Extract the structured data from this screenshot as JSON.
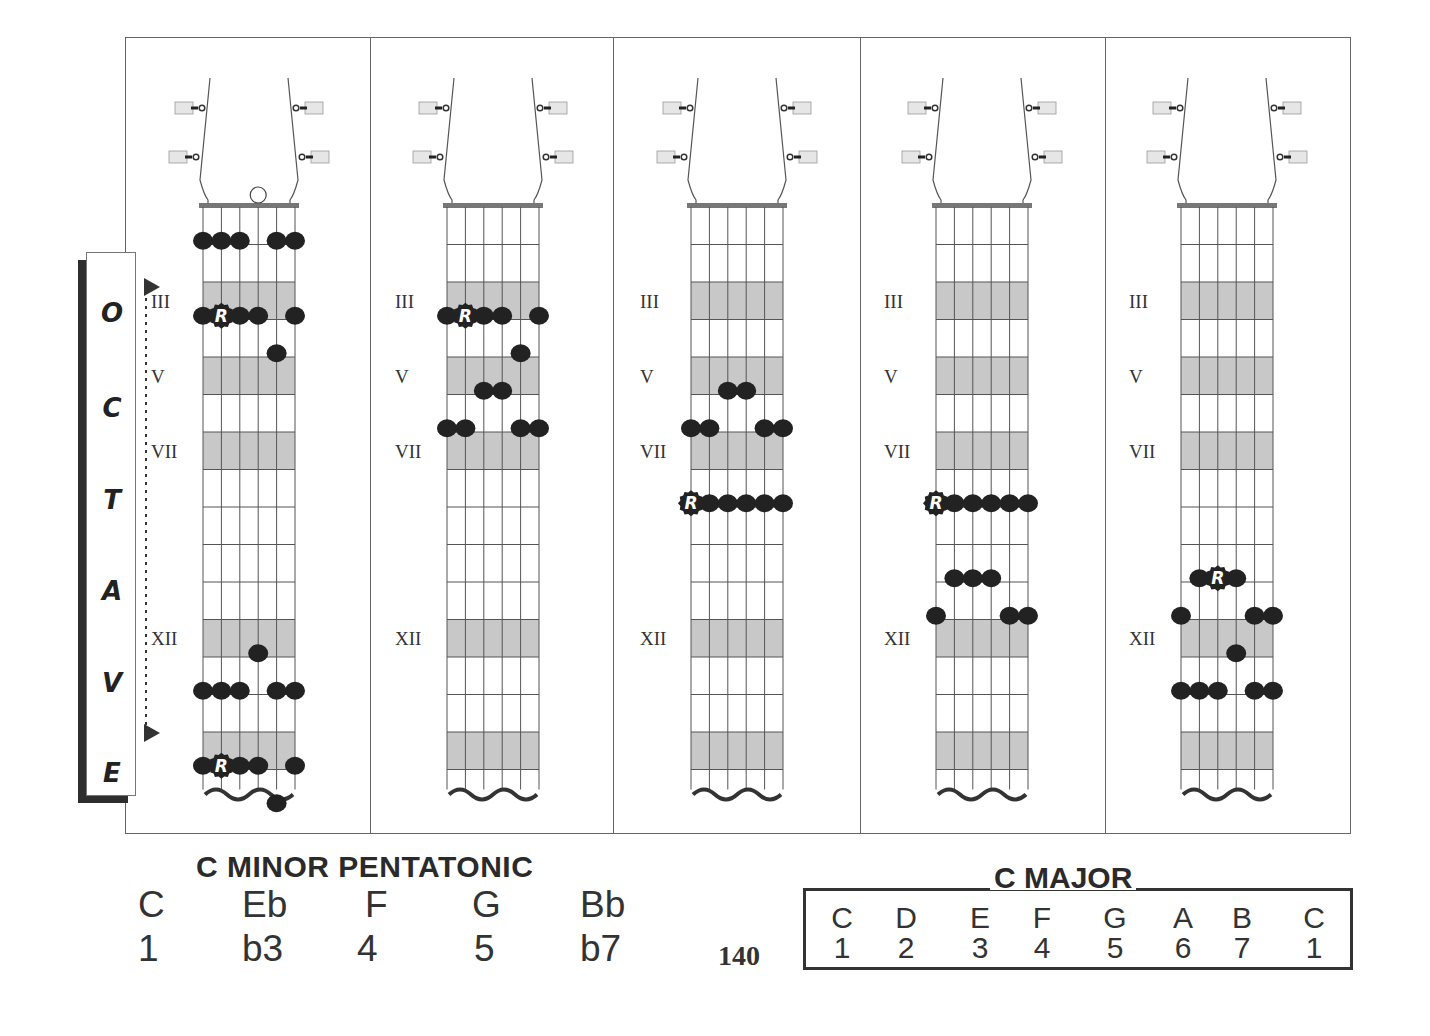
{
  "page": {
    "page_number": "140",
    "colors": {
      "fret_shading": "#c8c8c8",
      "dot": "#222222",
      "line": "#555555",
      "text": "#333333"
    }
  },
  "octave_label": {
    "letters": [
      "O",
      "C",
      "T",
      "A",
      "V",
      "E"
    ],
    "word": "OCTAVE"
  },
  "fretboard_config": {
    "strings": 6,
    "frets_shown": 15,
    "shaded_frets": [
      3,
      5,
      7,
      12,
      15
    ],
    "position_markers": [
      {
        "fret": 3,
        "label": "III"
      },
      {
        "fret": 5,
        "label": "V"
      },
      {
        "fret": 7,
        "label": "VII"
      },
      {
        "fret": 12,
        "label": "XII"
      }
    ],
    "root_symbol": "R",
    "string_order_note": "string 6 = low E (left) ... string 1 = high E (right)"
  },
  "diagrams": [
    {
      "id": "pattern-1",
      "open_string_marker": {
        "string": 3,
        "label": "open circle above nut"
      },
      "notes": [
        {
          "fret": 1,
          "strings": [
            6,
            5,
            4,
            2,
            1
          ]
        },
        {
          "fret": 3,
          "strings": [
            6,
            5,
            4,
            3,
            1
          ],
          "root_string": 5
        },
        {
          "fret": 4,
          "strings": [
            2
          ]
        },
        {
          "fret": 12,
          "strings": [
            3
          ]
        },
        {
          "fret": 13,
          "strings": [
            6,
            5,
            4,
            2,
            1
          ]
        },
        {
          "fret": 15,
          "strings": [
            6,
            5,
            4,
            3,
            1
          ],
          "root_string": 5
        },
        {
          "fret": 16,
          "strings": [
            2
          ]
        }
      ]
    },
    {
      "id": "pattern-2",
      "notes": [
        {
          "fret": 3,
          "strings": [
            6,
            5,
            4,
            3,
            1
          ],
          "root_string": 5
        },
        {
          "fret": 4,
          "strings": [
            2
          ]
        },
        {
          "fret": 5,
          "strings": [
            4,
            3
          ]
        },
        {
          "fret": 6,
          "strings": [
            6,
            5,
            2,
            1
          ]
        }
      ]
    },
    {
      "id": "pattern-3",
      "notes": [
        {
          "fret": 5,
          "strings": [
            4,
            3
          ]
        },
        {
          "fret": 6,
          "strings": [
            6,
            5,
            2,
            1
          ]
        },
        {
          "fret": 8,
          "strings": [
            6,
            5,
            4,
            3,
            2,
            1
          ],
          "root_string": 6
        }
      ]
    },
    {
      "id": "pattern-4",
      "notes": [
        {
          "fret": 8,
          "strings": [
            6,
            5,
            4,
            3,
            2,
            1
          ],
          "root_string": 6
        },
        {
          "fret": 10,
          "strings": [
            5,
            4,
            3
          ]
        },
        {
          "fret": 11,
          "strings": [
            6,
            2,
            1
          ]
        }
      ]
    },
    {
      "id": "pattern-5",
      "notes": [
        {
          "fret": 10,
          "strings": [
            5,
            4,
            3
          ],
          "root_string": 4
        },
        {
          "fret": 11,
          "strings": [
            6,
            2,
            1
          ]
        },
        {
          "fret": 12,
          "strings": [
            3
          ]
        },
        {
          "fret": 13,
          "strings": [
            6,
            5,
            4,
            2,
            1
          ]
        }
      ]
    }
  ],
  "minor_pentatonic": {
    "title": "C MINOR PENTATONIC",
    "notes": [
      "C",
      "Eb",
      "F",
      "G",
      "Bb"
    ],
    "degrees": [
      "1",
      "b3",
      "4",
      "5",
      "b7"
    ]
  },
  "major": {
    "title": "C MAJOR",
    "notes": [
      "C",
      "D",
      "E",
      "F",
      "G",
      "A",
      "B",
      "C"
    ],
    "degrees": [
      "1",
      "2",
      "3",
      "4",
      "5",
      "6",
      "7",
      "1"
    ]
  }
}
